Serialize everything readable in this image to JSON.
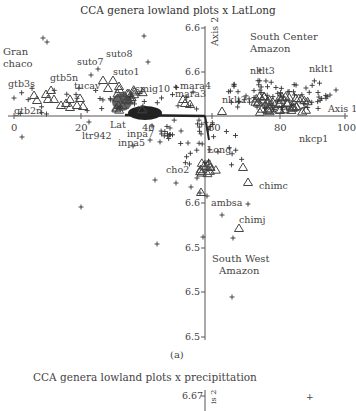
{
  "figure": {
    "panel_label": "(a)",
    "next_panel_title": "CCA genera lowland plots x precipittation",
    "next_panel_first_tick": "6.67",
    "next_panel_axis_label": "Axis 2"
  },
  "chart_data": {
    "type": "scatter",
    "title": "CCA genera lowland plots x LatLong",
    "xlabel": "Axis 1",
    "ylabel": "Axis 2",
    "x_ticks": [
      "0",
      "20",
      "40",
      "60",
      "80",
      "100"
    ],
    "y_ticks": [
      "6.6",
      "6.6",
      "6.6",
      "6.5",
      "6.5",
      "6.5"
    ],
    "xlim": [
      0,
      100
    ],
    "grid": false,
    "legend": "none",
    "region_labels": [
      "Gran chaco",
      "South Center Amazon",
      "South West Amazon"
    ],
    "vectors": [
      {
        "name": "Lat",
        "direction": "left (negative Axis 1)"
      },
      {
        "name": "Long",
        "direction": "down (negative Axis 2)"
      }
    ],
    "series": [
      {
        "name": "plots",
        "marker": "triangle"
      },
      {
        "name": "genera",
        "marker": "plus"
      }
    ],
    "plot_labels": [
      "gtb3s",
      "gtb5n",
      "gtb2n",
      "suto7",
      "suto8",
      "suto1",
      "tucav",
      "smig10",
      "ltr942",
      "Lat",
      "inpa7",
      "inpa5",
      "mara4",
      "mara3",
      "nklt2",
      "nklt3",
      "nklt1",
      "nkcp1",
      "Long",
      "cho2",
      "chimc",
      "ambsa",
      "chimj"
    ]
  },
  "labels": {
    "gran_chaco_1": "Gran",
    "gran_chaco_2": "chaco",
    "sc_amazon_1": "South Center",
    "sc_amazon_2": "Amazon",
    "sw_amazon_1": "South West",
    "sw_amazon_2": "Amazon",
    "axis1": "Axis 1",
    "axis2": "Axis 2"
  }
}
